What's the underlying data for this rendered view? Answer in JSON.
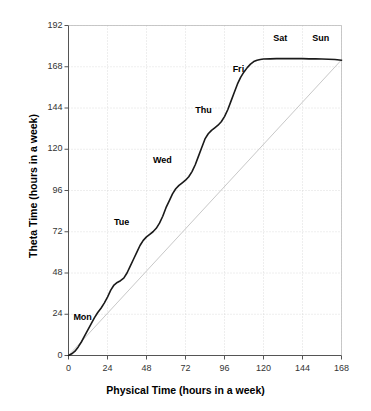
{
  "figure": {
    "faint_top_caption": "",
    "background": "#ffffff"
  },
  "chart_data": {
    "type": "line",
    "title": "",
    "xlabel": "Physical Time (hours in a week)",
    "ylabel": "Theta Time (hours in a week)",
    "xlim": [
      0,
      168
    ],
    "ylim": [
      0,
      192
    ],
    "xticks": [
      0,
      24,
      48,
      72,
      96,
      120,
      144,
      168
    ],
    "yticks": [
      0,
      24,
      48,
      72,
      96,
      120,
      144,
      168,
      192
    ],
    "grid": true,
    "legend_position": "none",
    "series": [
      {
        "name": "Theta Time",
        "color": "#1a1a1a",
        "linewidth": 1.6,
        "x": [
          0,
          2,
          4,
          6,
          8,
          10,
          12,
          14,
          16,
          18,
          20,
          22,
          24,
          26,
          28,
          30,
          32,
          34,
          36,
          38,
          40,
          42,
          44,
          46,
          48,
          50,
          52,
          54,
          56,
          58,
          60,
          62,
          64,
          66,
          68,
          70,
          72,
          74,
          76,
          78,
          80,
          82,
          84,
          86,
          88,
          90,
          92,
          94,
          96,
          98,
          100,
          102,
          104,
          106,
          108,
          110,
          112,
          114,
          116,
          118,
          120,
          124,
          128,
          132,
          136,
          140,
          144,
          148,
          152,
          156,
          160,
          164,
          168
        ],
        "y": [
          0,
          1,
          2.5,
          5,
          8,
          11.5,
          15,
          18.5,
          22,
          25,
          27.5,
          30.5,
          34,
          38,
          41,
          42.5,
          43.5,
          45,
          48,
          52,
          56,
          60,
          64,
          67,
          69,
          70.5,
          72,
          74,
          77,
          81,
          86,
          90,
          94,
          97,
          99,
          100.5,
          102,
          104,
          107,
          111,
          116,
          121,
          126,
          129,
          131,
          132.5,
          134,
          136,
          139,
          143,
          148,
          153,
          158,
          162,
          165,
          167.5,
          169.5,
          171,
          171.8,
          172.2,
          172.5,
          172.6,
          172.7,
          172.7,
          172.7,
          172.7,
          172.7,
          172.6,
          172.6,
          172.5,
          172.4,
          172.2,
          171.8
        ]
      },
      {
        "name": "Reference (y = x)",
        "color": "#c8c8c8",
        "linewidth": 1.0,
        "x": [
          0,
          168
        ],
        "y": [
          0,
          172
        ]
      }
    ],
    "annotations": [
      {
        "label": "Mon",
        "x": 3,
        "y": 22
      },
      {
        "label": "Tue",
        "x": 28,
        "y": 77
      },
      {
        "label": "Wed",
        "x": 52,
        "y": 113
      },
      {
        "label": "Thu",
        "x": 78,
        "y": 142
      },
      {
        "label": "Fri",
        "x": 101,
        "y": 166
      },
      {
        "label": "Sat",
        "x": 126,
        "y": 184
      },
      {
        "label": "Sun",
        "x": 150,
        "y": 184
      }
    ]
  }
}
